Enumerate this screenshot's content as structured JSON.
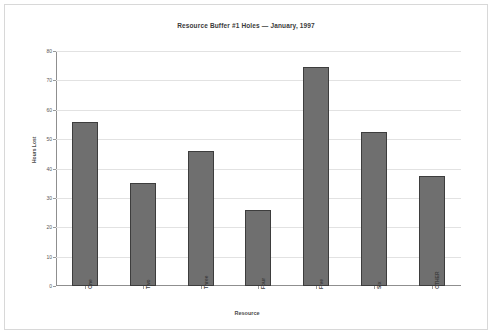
{
  "chart_data": {
    "type": "bar",
    "title": "Resource Buffer #1 Holes — January, 1997",
    "xlabel": "Resource",
    "ylabel": "Hours Lost",
    "categories": [
      "One",
      "Two",
      "Three",
      "Four",
      "Five",
      "Six",
      "OTHER"
    ],
    "values": [
      56,
      35,
      46,
      26,
      74.5,
      52.5,
      37.5
    ],
    "ylim": [
      0,
      80
    ],
    "ytick_step": 10,
    "yticks": [
      0,
      10,
      20,
      30,
      40,
      50,
      60,
      70,
      80
    ],
    "ytick_labels": [
      "0",
      "10",
      "20",
      "30",
      "40",
      "50",
      "60",
      "70",
      "80"
    ],
    "grid": true,
    "legend": null,
    "bar_color": "#6f6f6f",
    "bar_edge_color": "#3d3d3d",
    "grid_color": "#e2e2e2",
    "axis_color": "#8f8f8f",
    "background": "#ffffff",
    "border_color": "#d8d8d8"
  }
}
